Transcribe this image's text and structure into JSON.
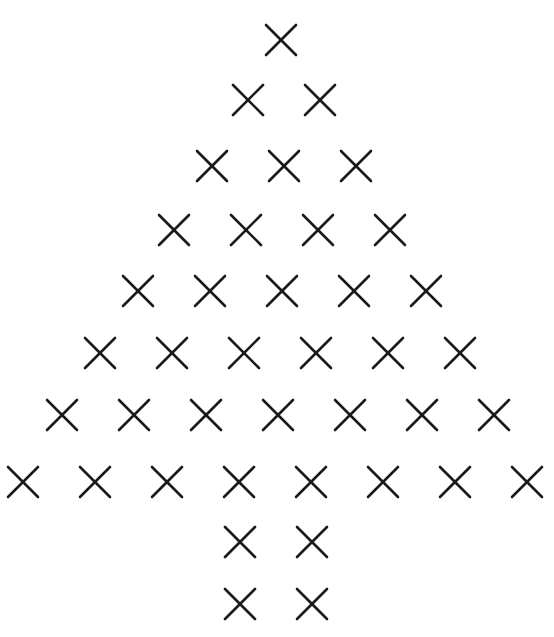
{
  "diagram": {
    "title": "",
    "mark_symbol": "x-mark",
    "mark_color": "#1a1a1a",
    "background": "#ffffff",
    "mark_size": 34,
    "rows": [
      {
        "y": 40,
        "x": [
          281
        ]
      },
      {
        "y": 100,
        "x": [
          248,
          320
        ]
      },
      {
        "y": 166,
        "x": [
          212,
          284,
          356
        ]
      },
      {
        "y": 230,
        "x": [
          174,
          246,
          318,
          390
        ]
      },
      {
        "y": 291,
        "x": [
          138,
          210,
          282,
          354,
          426
        ]
      },
      {
        "y": 353,
        "x": [
          100,
          172,
          244,
          316,
          388,
          460
        ]
      },
      {
        "y": 415,
        "x": [
          62,
          134,
          206,
          278,
          350,
          422,
          494
        ]
      },
      {
        "y": 482,
        "x": [
          23,
          95,
          167,
          239,
          311,
          383,
          455,
          527
        ]
      },
      {
        "y": 542,
        "x": [
          240,
          312
        ]
      },
      {
        "y": 604,
        "x": [
          240,
          312
        ]
      }
    ],
    "row_counts": [
      1,
      2,
      3,
      4,
      5,
      6,
      7,
      8,
      2,
      2
    ]
  }
}
